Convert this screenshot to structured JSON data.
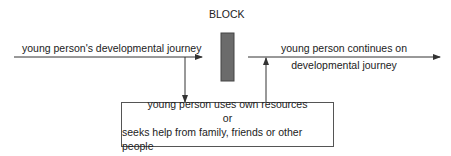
{
  "diagram": {
    "block_label": "BLOCK",
    "left_arrow_label": "young person's developmental journey",
    "right_arrow_label_line1": "young person continues on",
    "right_arrow_label_line2": "developmental journey",
    "box": {
      "line1": "young person uses own resources",
      "line2": "or",
      "line3": "seeks help from family, friends or other people"
    },
    "colors": {
      "block_fill": "#6b6b6b",
      "line": "#333333",
      "text": "#222222"
    }
  }
}
